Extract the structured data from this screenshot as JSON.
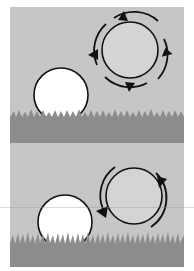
{
  "figure": {
    "colors": {
      "sky": "#c6c6c6",
      "grass": "#8c8c8c",
      "grass_blade": "#9a9a9a",
      "ball_fill": "#ffffff",
      "ring_fill": "#d4d4d4",
      "stroke": "#111111",
      "background": "#ffffff"
    },
    "panels": [
      {
        "id": "top",
        "ball": {
          "cx": 51,
          "cy": 88,
          "r": 27
        },
        "wheel": {
          "cx": 120,
          "cy": 43,
          "r": 28,
          "outer_ring_r": 36,
          "arrow_count": 4,
          "style": "segmented ring with arrowheads at 4 points"
        },
        "grass_top": 108
      },
      {
        "id": "bottom",
        "ball": {
          "cx": 55,
          "cy": 79,
          "r": 27
        },
        "wheel": {
          "cx": 124,
          "cy": 53,
          "r": 28,
          "outer_arc_r": 35,
          "arrow_count": 2,
          "style": "two curved arrows around circle"
        },
        "grass_top": 98
      }
    ]
  }
}
